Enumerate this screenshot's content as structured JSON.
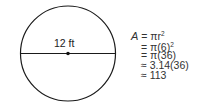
{
  "diagram": {
    "shape": "circle",
    "diameter_label": "12 ft",
    "center_marked": true
  },
  "equations": [
    {
      "lhs": "A",
      "op": "=",
      "rhs": "πr",
      "sup": "2"
    },
    {
      "lhs": "",
      "op": "=",
      "rhs": "π(6)",
      "sup": "2"
    },
    {
      "lhs": "",
      "op": "=",
      "rhs": "π(36)",
      "sup": ""
    },
    {
      "lhs": "",
      "op": "≈",
      "rhs": "3.14(36)",
      "sup": ""
    },
    {
      "lhs": "",
      "op": "≈",
      "rhs": "113",
      "sup": ""
    }
  ],
  "colors": {
    "stroke": "#1a1a1a",
    "text": "#333333"
  }
}
